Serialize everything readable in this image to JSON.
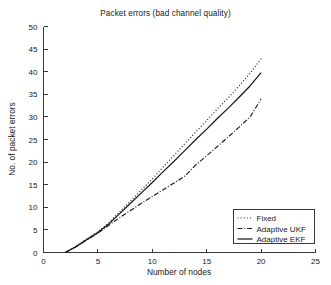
{
  "chart_data": {
    "type": "line",
    "title": "Packet errors (bad channel quality)",
    "xlabel": "Number of nodes",
    "ylabel": "No. of packet errors",
    "xlim": [
      0,
      25
    ],
    "ylim": [
      0,
      50
    ],
    "xticks": [
      0,
      5,
      10,
      15,
      20,
      25
    ],
    "yticks": [
      0,
      5,
      10,
      15,
      20,
      25,
      30,
      35,
      40,
      45,
      50
    ],
    "grid": false,
    "legend_position": "lower right",
    "x": [
      2,
      3,
      4,
      5,
      6,
      7,
      8,
      9,
      10,
      11,
      12,
      13,
      14,
      15,
      16,
      17,
      18,
      19,
      20
    ],
    "series": [
      {
        "name": "Fixed",
        "style": "dotted",
        "color": "#1b1b1b",
        "values": [
          0,
          1.4,
          3.0,
          4.6,
          6.6,
          9.0,
          11.4,
          13.8,
          16.3,
          18.9,
          21.5,
          24.1,
          26.7,
          29.2,
          31.8,
          34.3,
          36.9,
          39.7,
          42.9
        ]
      },
      {
        "name": "Adaptive UKF",
        "style": "dashdot",
        "color": "#1b1b1b",
        "values": [
          0,
          1.3,
          2.8,
          4.3,
          6.0,
          7.7,
          9.3,
          10.9,
          12.4,
          13.9,
          15.4,
          16.9,
          19.4,
          21.4,
          23.5,
          25.6,
          27.8,
          30.0,
          34.0
        ]
      },
      {
        "name": "Adaptive EKF",
        "style": "solid",
        "color": "#1b1b1b",
        "values": [
          0,
          1.3,
          2.9,
          4.4,
          6.3,
          8.6,
          10.9,
          13.2,
          15.5,
          17.9,
          20.2,
          22.6,
          25.0,
          27.3,
          29.7,
          32.0,
          34.4,
          36.9,
          39.8
        ]
      }
    ]
  },
  "legend": {
    "items": [
      {
        "label": "Fixed",
        "style": "dotted"
      },
      {
        "label": "Adaptive UKF",
        "style": "dashdot"
      },
      {
        "label": "Adaptive EKF",
        "style": "solid"
      }
    ]
  }
}
